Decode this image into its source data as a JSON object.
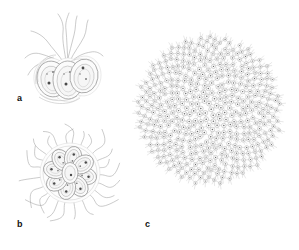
{
  "figure": {
    "type": "scientific-line-drawing",
    "background_color": "#ffffff",
    "width": 299,
    "height": 250,
    "style": "grayscale stipple-and-line biological illustration",
    "panels": [
      {
        "id": "a",
        "label": "a",
        "label_position": {
          "x": 17,
          "y": 94
        },
        "caption": "",
        "description": "Small cluster of three overlapping ovoid flagellated cells with long wavy flagella extending upward",
        "cell_count": 3,
        "flagella_count": 6,
        "bounds": {
          "x": 22,
          "y": 12,
          "width": 84,
          "height": 88
        }
      },
      {
        "id": "b",
        "label": "b",
        "label_position": {
          "x": 17,
          "y": 220
        },
        "caption": "",
        "description": "Rosette colony of ovoid cells arranged radially with flagella radiating outward in all directions",
        "cell_count": 9,
        "flagella_count": 24,
        "bounds": {
          "x": 20,
          "y": 126,
          "width": 96,
          "height": 94
        }
      },
      {
        "id": "c",
        "label": "c",
        "label_position": {
          "x": 145,
          "y": 220
        },
        "caption": "",
        "description": "Large spherical colony composed of hundreds of small cells in a polygonal network on the sphere surface",
        "cell_count": 420,
        "bounds": {
          "x": 133,
          "y": 30,
          "width": 150,
          "height": 162
        }
      }
    ],
    "colors": {
      "line": "#9a9a9a",
      "line_soft": "#b4b4b4",
      "cell_fill": "#fbfbfb",
      "organelle": "#4a4a4a",
      "label_text": "#111111",
      "background": "#ffffff"
    }
  }
}
